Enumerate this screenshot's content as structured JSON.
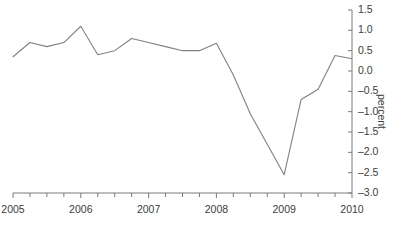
{
  "chart_data": {
    "type": "line",
    "title": "",
    "subtitle": "",
    "xlabel": "",
    "ylabel": "percent",
    "xlim": [
      2005.0,
      2010.0
    ],
    "ylim": [
      -3.0,
      1.5
    ],
    "grid": false,
    "legend": null,
    "y_axis_position": "right",
    "x_tick_labels": [
      "2005",
      "2006",
      "2007",
      "2008",
      "2009",
      "2010"
    ],
    "x_tick_values": [
      2005,
      2006,
      2007,
      2008,
      2009,
      2010
    ],
    "x_minor_ticks_per_interval": 4,
    "y_tick_labels": [
      "1.5",
      "1.0",
      "0.5",
      "0.0",
      "–0.5",
      "–1.0",
      "–1.5",
      "–2.0",
      "–2.5",
      "–3.0"
    ],
    "y_tick_values": [
      1.5,
      1.0,
      0.5,
      0.0,
      -0.5,
      -1.0,
      -1.5,
      -2.0,
      -2.5,
      -3.0
    ],
    "series": [
      {
        "name": "percent",
        "color": "#808080",
        "line_width": 1.1,
        "x": [
          2005.0,
          2005.25,
          2005.5,
          2005.75,
          2006.0,
          2006.25,
          2006.5,
          2006.75,
          2007.0,
          2007.25,
          2007.5,
          2007.75,
          2008.0,
          2008.25,
          2008.5,
          2008.75,
          2009.0,
          2009.25,
          2009.5,
          2009.75,
          2010.0
        ],
        "values": [
          0.35,
          0.7,
          0.6,
          0.7,
          1.1,
          0.4,
          0.5,
          0.8,
          0.7,
          0.6,
          0.5,
          0.5,
          0.68,
          -0.1,
          -1.05,
          -1.8,
          -2.55,
          -0.7,
          -0.45,
          0.38,
          0.3
        ]
      }
    ],
    "annotations": []
  },
  "axis": {
    "spine_color": "#7a7a7a",
    "tick_color": "#7a7a7a",
    "label_color": "#3c3c3c"
  }
}
